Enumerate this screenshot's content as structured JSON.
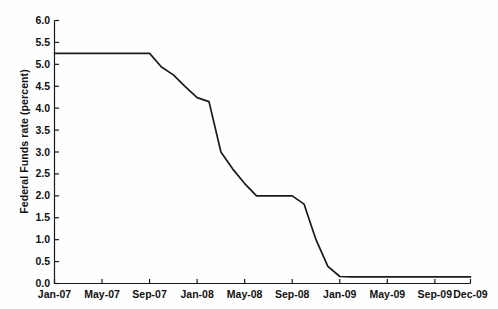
{
  "chart_data": {
    "type": "line",
    "title": "",
    "xlabel": "",
    "ylabel": "Federal Funds rate (percent)",
    "ylim": [
      0.0,
      6.0
    ],
    "ytick_labels": [
      "0.0",
      "0.5",
      "1.0",
      "1.5",
      "2.0",
      "2.5",
      "3.0",
      "3.5",
      "4.0",
      "4.5",
      "5.0",
      "5.5",
      "6.0"
    ],
    "ytick_values": [
      0.0,
      0.5,
      1.0,
      1.5,
      2.0,
      2.5,
      3.0,
      3.5,
      4.0,
      4.5,
      5.0,
      5.5,
      6.0
    ],
    "xtick_labels": [
      "Jan-07",
      "May-07",
      "Sep-07",
      "Jan-08",
      "May-08",
      "Sep-08",
      "Jan-09",
      "May-09",
      "Sep-09",
      "Dec-09"
    ],
    "xtick_values": [
      0,
      4,
      8,
      12,
      16,
      20,
      24,
      28,
      32,
      35
    ],
    "grid": false,
    "legend": "none",
    "line_color": "#1a1a1a",
    "axis_color": "#1a1a1a",
    "background_color": "#ffffff",
    "x_unit": "months since Jan-2007",
    "x_range": [
      0,
      35
    ],
    "series": [
      {
        "name": "Federal Funds rate",
        "x": [
          0,
          1,
          2,
          3,
          4,
          5,
          6,
          7,
          8,
          9,
          10,
          11,
          12,
          13,
          14,
          15,
          16,
          17,
          18,
          19,
          20,
          21,
          22,
          23,
          24,
          25,
          26,
          27,
          28,
          29,
          30,
          31,
          32,
          33,
          34,
          35
        ],
        "values": [
          5.25,
          5.25,
          5.25,
          5.25,
          5.25,
          5.25,
          5.25,
          5.25,
          5.25,
          4.94,
          4.76,
          4.49,
          4.24,
          4.15,
          3.0,
          2.61,
          2.28,
          2.0,
          2.0,
          2.0,
          2.0,
          1.81,
          1.0,
          0.39,
          0.16,
          0.15,
          0.15,
          0.15,
          0.15,
          0.15,
          0.15,
          0.15,
          0.15,
          0.15,
          0.15,
          0.15
        ],
        "labels": [
          "Jan-07",
          "Feb-07",
          "Mar-07",
          "Apr-07",
          "May-07",
          "Jun-07",
          "Jul-07",
          "Aug-07",
          "Sep-07",
          "Oct-07",
          "Nov-07",
          "Dec-07",
          "Jan-08",
          "Feb-08",
          "Mar-08",
          "Apr-08",
          "May-08",
          "Jun-08",
          "Jul-08",
          "Aug-08",
          "Sep-08",
          "Oct-08",
          "Nov-08",
          "Dec-08",
          "Jan-09",
          "Feb-09",
          "Mar-09",
          "Apr-09",
          "May-09",
          "Jun-09",
          "Jul-09",
          "Aug-09",
          "Sep-09",
          "Oct-09",
          "Nov-09",
          "Dec-09"
        ]
      }
    ]
  }
}
